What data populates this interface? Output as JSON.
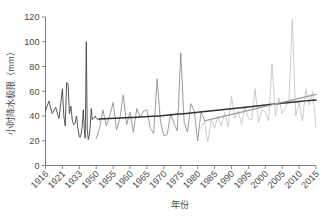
{
  "chart_data": {
    "type": "line",
    "title": "",
    "xlabel": "年份",
    "ylabel": "小时降水极限（mm）",
    "xlim": [
      1916,
      2015
    ],
    "ylim": [
      0,
      120
    ],
    "ytick_labels": [
      "0",
      "20",
      "40",
      "60",
      "80",
      "100",
      "120"
    ],
    "ytick_values": [
      0,
      20,
      40,
      60,
      80,
      100,
      120
    ],
    "xtick_labels": [
      "1916",
      "1921",
      "1933",
      "1950",
      "1955",
      "1960",
      "1965",
      "1970",
      "1975",
      "1980",
      "1985",
      "1990",
      "1995",
      "2000",
      "2005",
      "2010",
      "2015"
    ],
    "xtick_values": [
      1916,
      1921,
      1933,
      1950,
      1955,
      1960,
      1965,
      1970,
      1975,
      1980,
      1985,
      1990,
      1995,
      2000,
      2005,
      2010,
      2015
    ],
    "grid": false,
    "legend": "none",
    "colors": {
      "series_early": "#3b3b3b",
      "series_mid": "#8a8a8a",
      "series_late": "#c2c2c2",
      "trend_dark": "#303030",
      "trend_light": "#9a9a9a",
      "axis": "#6e6e6e",
      "text": "#4a4a4a"
    },
    "series": [
      {
        "name": "早期观测",
        "color": "#3b3b3b",
        "x": [
          1916,
          1917,
          1918,
          1919,
          1920,
          1921,
          1922,
          1923,
          1924,
          1925,
          1926,
          1927,
          1928,
          1929,
          1930,
          1931,
          1932,
          1933,
          1934,
          1935,
          1936,
          1937,
          1938,
          1939,
          1940,
          1941,
          1942,
          1943,
          1944,
          1945,
          1946,
          1947,
          1948,
          1949,
          1950,
          1951
        ],
        "values": [
          44,
          52,
          42,
          47,
          38,
          62,
          40,
          32,
          67,
          66,
          42,
          48,
          37,
          33,
          34,
          40,
          30,
          23,
          23,
          26,
          32,
          45,
          30,
          22,
          100,
          29,
          21,
          24,
          32,
          46,
          37,
          38,
          39,
          40,
          38,
          37
        ]
      },
      {
        "name": "中期观测",
        "color": "#8a8a8a",
        "x": [
          1950,
          1951,
          1952,
          1953,
          1954,
          1955,
          1956,
          1957,
          1958,
          1959,
          1960,
          1961,
          1962,
          1963,
          1964,
          1965,
          1966,
          1967,
          1968,
          1969,
          1970,
          1971,
          1972,
          1973,
          1974,
          1975,
          1976,
          1977,
          1978,
          1979,
          1980,
          1981,
          1982
        ],
        "values": [
          22,
          30,
          45,
          32,
          40,
          51,
          29,
          38,
          57,
          33,
          43,
          27,
          46,
          39,
          44,
          45,
          30,
          26,
          70,
          36,
          24,
          25,
          42,
          34,
          28,
          91,
          35,
          27,
          50,
          44,
          20,
          43,
          37
        ]
      },
      {
        "name": "近期观测",
        "color": "#c2c2c2",
        "x": [
          1981,
          1982,
          1983,
          1984,
          1985,
          1986,
          1987,
          1988,
          1989,
          1990,
          1991,
          1992,
          1993,
          1994,
          1995,
          1996,
          1997,
          1998,
          1999,
          2000,
          2001,
          2002,
          2003,
          2004,
          2005,
          2006,
          2007,
          2008,
          2009,
          2010,
          2011,
          2012,
          2013,
          2014,
          2015
        ],
        "values": [
          30,
          36,
          19,
          37,
          30,
          40,
          32,
          43,
          31,
          56,
          38,
          44,
          33,
          48,
          38,
          37,
          62,
          35,
          45,
          43,
          36,
          82,
          40,
          55,
          42,
          47,
          52,
          118,
          40,
          51,
          36,
          62,
          49,
          60,
          31
        ]
      }
    ],
    "trends": [
      {
        "name": "长期曲线趋势",
        "color": "#303030",
        "style": "curve",
        "x": [
          1951,
          1960,
          1970,
          1980,
          1990,
          2000,
          2010,
          2015
        ],
        "values": [
          37.5,
          38.8,
          40.5,
          43.0,
          45.8,
          48.8,
          51.8,
          53.0
        ]
      },
      {
        "name": "近期线性趋势",
        "color": "#9a9a9a",
        "style": "line",
        "x": [
          1982,
          2015
        ],
        "values": [
          36.0,
          57.5
        ]
      }
    ]
  }
}
